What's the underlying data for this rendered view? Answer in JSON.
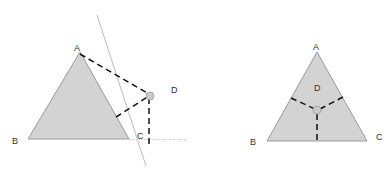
{
  "colors": {
    "fill": "#d3d3d3",
    "edge": "#999999",
    "dash": "#111111",
    "guide": "#aaaaaa"
  },
  "left_figure": {
    "label_A": "A",
    "label_B": "B",
    "label_C": "C",
    "label_D": "D"
  },
  "right_figure": {
    "label_A": "A",
    "label_B": "B",
    "label_C": "C",
    "label_D": "D"
  }
}
